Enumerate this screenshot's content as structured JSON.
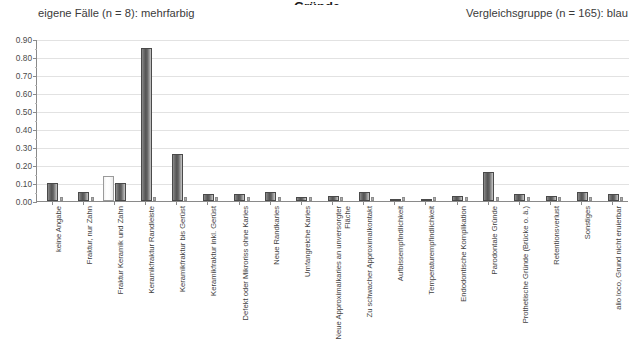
{
  "title_sliver": "Gründe",
  "legend": {
    "left": "eigene Fälle (n = 8): mehrfarbig",
    "right": "Vergleichsgruppe (n = 165): blau"
  },
  "chart_data": {
    "type": "bar",
    "title": "Gründe",
    "xlabel": "",
    "ylabel": "",
    "ylim": [
      0.0,
      0.9
    ],
    "grid": true,
    "legend_position": "top",
    "ytick_labels": [
      "0.90",
      "0.80",
      "0.70",
      "0.60",
      "0.50",
      "0.40",
      "0.30",
      "0.20",
      "0.10",
      "0.00"
    ],
    "ytick_values": [
      0.9,
      0.8,
      0.7,
      0.6,
      0.5,
      0.4,
      0.3,
      0.2,
      0.1,
      0.0
    ],
    "categories": [
      "keine Angabe",
      "Fraktur, nur Zahn",
      "Fraktur Keramik und Zahn",
      "Keramikfraktur Randleiste",
      "Keramikfraktur bis Gerüst",
      "Keramikfraktur inkl. Gerüst",
      "Defekt oder Mikroriss ohne Karies",
      "Neue Randkaries",
      "Umfangreiche Karies",
      "Neue Approximalkaries an unversorgter Fläche",
      "Zu schwacher Approximalkontakt",
      "Aufbissempfindlichkeit",
      "Temperaturempfindlichkeit",
      "Endodontische Komplikation",
      "Parodontale Gründe",
      "Prothetische Gründe (Brücke o. ä.)",
      "Retentionsverlust",
      "Sonstiges",
      "alio loco, Grund nicht eruierbar"
    ],
    "series": [
      {
        "name": "Vergleichsgruppe (n = 165): blau",
        "color": "#6e6e6e",
        "values": [
          0.1,
          0.05,
          0.1,
          0.85,
          0.26,
          0.04,
          0.04,
          0.05,
          0.02,
          0.03,
          0.05,
          0.0,
          0.0,
          0.03,
          0.16,
          0.04,
          0.03,
          0.05,
          0.04
        ]
      },
      {
        "name": "eigene Fälle (n = 8): mehrfarbig",
        "color": "#ffffff",
        "values": [
          0.01,
          0.01,
          0.14,
          0.01,
          0.01,
          0.01,
          0.01,
          0.01,
          0.01,
          0.01,
          0.01,
          0.01,
          0.01,
          0.01,
          0.01,
          0.01,
          0.01,
          0.01,
          0.01
        ]
      }
    ]
  }
}
